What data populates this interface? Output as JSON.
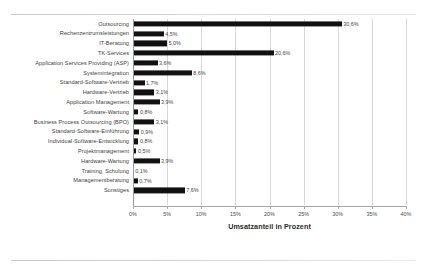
{
  "chart_data": {
    "type": "bar",
    "orientation": "horizontal",
    "title": "",
    "xlabel": "Umsatzanteil in Prozent",
    "ylabel": "",
    "xlim": [
      0,
      40
    ],
    "xtick_labels": [
      "0%",
      "5%",
      "10%",
      "15%",
      "20%",
      "25%",
      "30%",
      "35%",
      "40%"
    ],
    "xticks": [
      0,
      5,
      10,
      15,
      20,
      25,
      30,
      35,
      40
    ],
    "grid": true,
    "legend": null,
    "bar_color": "#111111",
    "categories": [
      "Outsourcing",
      "Rechenzentrumsleistungen",
      "IT-Beratung",
      "TK-Services",
      "Application Services Providing (ASP)",
      "Systemintegration",
      "Standard-Software-Vertrieb",
      "Hardware-Vertrieb",
      "Application Management",
      "Software-Wartung",
      "Business Process Outsourcing (BPO)",
      "Standard-Software-Einführung",
      "Individual-Software-Entwicklung",
      "Projektmanagement",
      "Hardware-Wartung",
      "Training, Schulung",
      "Managementberatung",
      "Sonstiges"
    ],
    "values": [
      30.6,
      4.5,
      5.0,
      20.6,
      3.6,
      8.6,
      1.7,
      3.1,
      3.9,
      0.8,
      3.1,
      0.9,
      0.8,
      0.5,
      3.9,
      0.1,
      0.7,
      7.6
    ],
    "value_labels": [
      "30,6%",
      "4,5%",
      "5,0%",
      "20,6%",
      "3,6%",
      "8,6%",
      "1,7%",
      "3,1%",
      "3,9%",
      "0,8%",
      "3,1%",
      "0,9%",
      "0,8%",
      "0,5%",
      "3,9%",
      "0,1%",
      "0,7%",
      "7,6%"
    ]
  }
}
